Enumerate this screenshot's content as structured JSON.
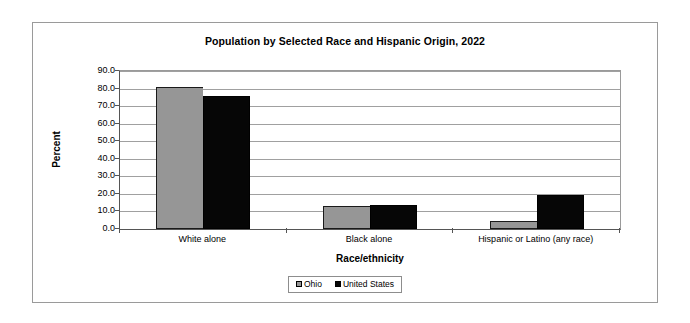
{
  "chart_data": {
    "type": "bar",
    "title": "Population by Selected Race and Hispanic Origin, 2022",
    "xlabel": "Race/ethnicity",
    "ylabel": "Percent",
    "categories": [
      "White alone",
      "Black alone",
      "Hispanic or Latino (any race)"
    ],
    "series": [
      {
        "name": "Ohio",
        "values": [
          81.0,
          13.3,
          4.6
        ],
        "color": "#969696"
      },
      {
        "name": "United States",
        "values": [
          75.5,
          13.6,
          19.1
        ],
        "color": "#060606"
      }
    ],
    "ylim": [
      0.0,
      90.0
    ],
    "ytick_step": 10.0,
    "ytick_labels": [
      "0.0",
      "10.0",
      "20.0",
      "30.0",
      "40.0",
      "50.0",
      "60.0",
      "70.0",
      "80.0",
      "90.0"
    ],
    "grid": true,
    "grid_axis": "y",
    "legend_position": "bottom",
    "legend_entries": [
      "Ohio",
      "United States"
    ]
  }
}
